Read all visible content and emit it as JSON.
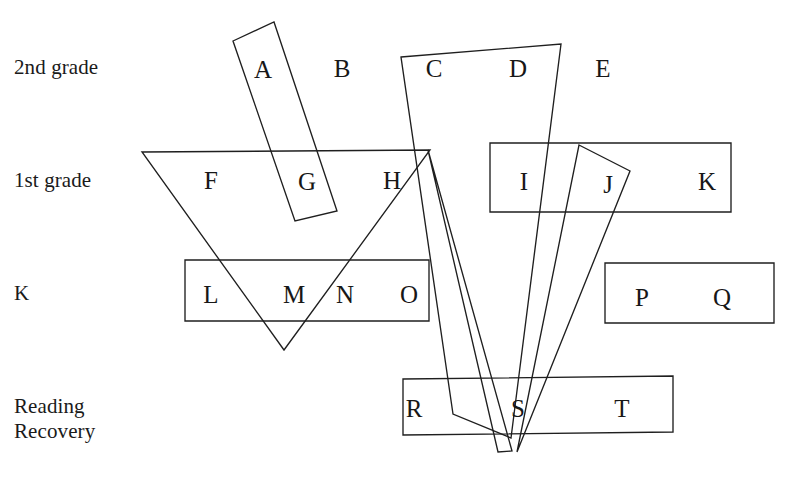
{
  "diagram": {
    "background_color": "#ffffff",
    "stroke_color": "#1f1f1f",
    "row_labels": [
      {
        "id": "row-2nd-grade",
        "text": "2nd grade",
        "x": 14,
        "y": 55
      },
      {
        "id": "row-1st-grade",
        "text": "1st grade",
        "x": 14,
        "y": 168
      },
      {
        "id": "row-k",
        "text": "K",
        "x": 14,
        "y": 281
      },
      {
        "id": "row-reading-recovery-line1",
        "text": "Reading",
        "x": 14,
        "y": 394
      },
      {
        "id": "row-reading-recovery-line2",
        "text": "Recovery",
        "x": 14,
        "y": 419
      }
    ],
    "letters": [
      {
        "id": "letter-a",
        "text": "A",
        "x": 263,
        "y": 69
      },
      {
        "id": "letter-b",
        "text": "B",
        "x": 342,
        "y": 68
      },
      {
        "id": "letter-c",
        "text": "C",
        "x": 434,
        "y": 68
      },
      {
        "id": "letter-d",
        "text": "D",
        "x": 518,
        "y": 68
      },
      {
        "id": "letter-e",
        "text": "E",
        "x": 603,
        "y": 68
      },
      {
        "id": "letter-f",
        "text": "F",
        "x": 211,
        "y": 180
      },
      {
        "id": "letter-g",
        "text": "G",
        "x": 307,
        "y": 181
      },
      {
        "id": "letter-h",
        "text": "H",
        "x": 392,
        "y": 180
      },
      {
        "id": "letter-i",
        "text": "I",
        "x": 524,
        "y": 181
      },
      {
        "id": "letter-j",
        "text": "J",
        "x": 608,
        "y": 184
      },
      {
        "id": "letter-k-cell",
        "text": "K",
        "x": 707,
        "y": 181
      },
      {
        "id": "letter-l",
        "text": "L",
        "x": 211,
        "y": 294
      },
      {
        "id": "letter-m",
        "text": "M",
        "x": 294,
        "y": 294
      },
      {
        "id": "letter-n",
        "text": "N",
        "x": 345,
        "y": 294
      },
      {
        "id": "letter-o",
        "text": "O",
        "x": 409,
        "y": 294
      },
      {
        "id": "letter-p",
        "text": "P",
        "x": 642,
        "y": 297
      },
      {
        "id": "letter-q",
        "text": "Q",
        "x": 722,
        "y": 297
      },
      {
        "id": "letter-r",
        "text": "R",
        "x": 414,
        "y": 408
      },
      {
        "id": "letter-s",
        "text": "S",
        "x": 518,
        "y": 408
      },
      {
        "id": "letter-t",
        "text": "T",
        "x": 622,
        "y": 408
      }
    ],
    "shapes": [
      {
        "id": "group-ag-rectangle",
        "name": "slanted-rectangle-a-g",
        "type": "polygon",
        "points": "233,41 274,22 337,211 295,221"
      },
      {
        "id": "group-fgh-triangle",
        "name": "triangle-f-g-h",
        "type": "polygon",
        "points": "142,152 430,150 284,350"
      },
      {
        "id": "group-lmno-rectangle",
        "name": "rectangle-l-m-n-o",
        "type": "polygon",
        "points": "185,260 429,260 429,321 185,321"
      },
      {
        "id": "group-ijk-rectangle",
        "name": "rectangle-i-j-k",
        "type": "polygon",
        "points": "490,143 731,143 731,212 490,212"
      },
      {
        "id": "group-cd-quadrilateral",
        "name": "quadrilateral-c-d-s",
        "type": "polygon",
        "points": "401,57 561,44 511,438 453,414"
      },
      {
        "id": "group-j-narrow-triangle",
        "name": "narrow-triangle-j-s",
        "type": "polygon",
        "points": "579,145 630,171 517,452"
      },
      {
        "id": "group-h-narrow-triangle",
        "name": "narrow-triangle-h-s",
        "type": "polygon",
        "points": "428,150 512,451 498,452"
      },
      {
        "id": "group-pq-rectangle",
        "name": "rectangle-p-q",
        "type": "polygon",
        "points": "605,263 774,263 774,323 605,323"
      },
      {
        "id": "group-rst-rectangle",
        "name": "rectangle-r-s-t",
        "type": "polygon",
        "points": "403,379 673,376 673,432 403,435"
      }
    ]
  }
}
